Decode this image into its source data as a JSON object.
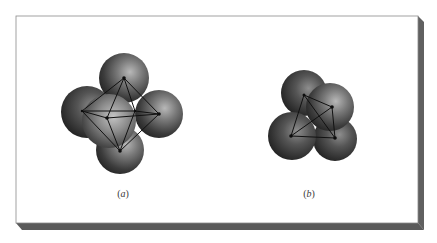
{
  "figure": {
    "panels": [
      {
        "id": "a",
        "label": "(a)",
        "label_letter": "a",
        "structure": "octahedral",
        "sphere_count": 5,
        "polyhedron": "octahedron"
      },
      {
        "id": "b",
        "label": "(b)",
        "label_letter": "b",
        "structure": "tetrahedral",
        "sphere_count": 4,
        "polyhedron": "tetrahedron"
      }
    ]
  },
  "colors": {
    "background": "#ffffff",
    "panel": "#ffffff",
    "panel_border": "#8a8a8a",
    "shadow": "#5e5e5e",
    "sphere_dark": "#2a2a2a",
    "sphere_mid": "#6a6a6a",
    "sphere_light": "#b5b5b5",
    "edge_line": "#111111",
    "caption_text": "#3a3a3a"
  }
}
